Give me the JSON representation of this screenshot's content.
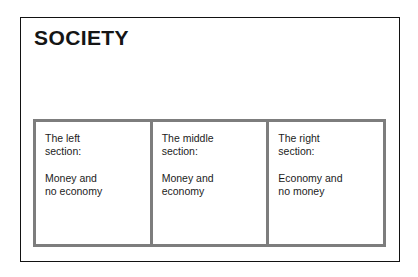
{
  "diagram": {
    "title": "SOCIETY",
    "colors": {
      "outer_border": "#121212",
      "section_border": "#7d7d7d",
      "text": "#1c1c1c",
      "background": "#ffffff"
    },
    "sections": [
      {
        "name": "left",
        "heading": "The left\nsection:",
        "body": "Money and\nno economy"
      },
      {
        "name": "middle",
        "heading": "The middle\nsection:",
        "body": "Money and\neconomy"
      },
      {
        "name": "right",
        "heading": "The right\nsection:",
        "body": "Economy and\nno money"
      }
    ]
  }
}
